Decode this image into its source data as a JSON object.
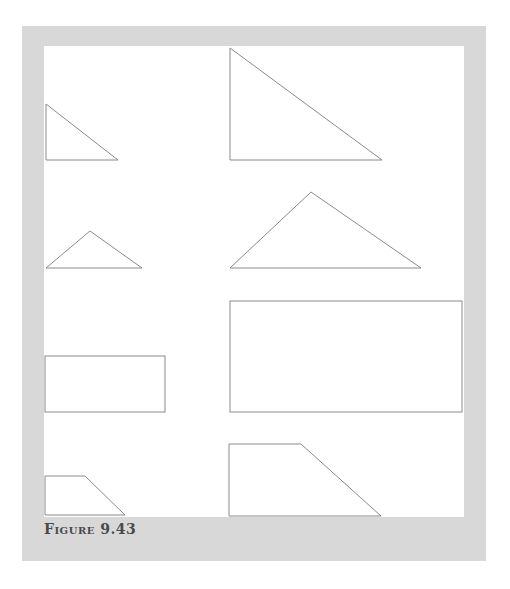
{
  "figure": {
    "caption": "Figure 9.43",
    "colors": {
      "frame": "#d8d8d8",
      "panel": "#ffffff",
      "stroke": "#8a8a8a",
      "caption": "#4a4a4a"
    },
    "shapes": [
      {
        "id": "small-right-triangle",
        "kind": "right-triangle",
        "size": "small",
        "column": "left"
      },
      {
        "id": "large-right-triangle",
        "kind": "right-triangle",
        "size": "large",
        "column": "right"
      },
      {
        "id": "small-obtuse-triangle",
        "kind": "obtuse-triangle",
        "size": "small",
        "column": "left"
      },
      {
        "id": "large-obtuse-triangle",
        "kind": "obtuse-triangle",
        "size": "large",
        "column": "right"
      },
      {
        "id": "small-rectangle",
        "kind": "rectangle",
        "size": "small",
        "column": "left"
      },
      {
        "id": "large-rectangle",
        "kind": "rectangle",
        "size": "large",
        "column": "right"
      },
      {
        "id": "small-trapezoid",
        "kind": "trapezoid",
        "size": "small",
        "column": "left"
      },
      {
        "id": "large-trapezoid",
        "kind": "trapezoid",
        "size": "large",
        "column": "right"
      }
    ]
  }
}
